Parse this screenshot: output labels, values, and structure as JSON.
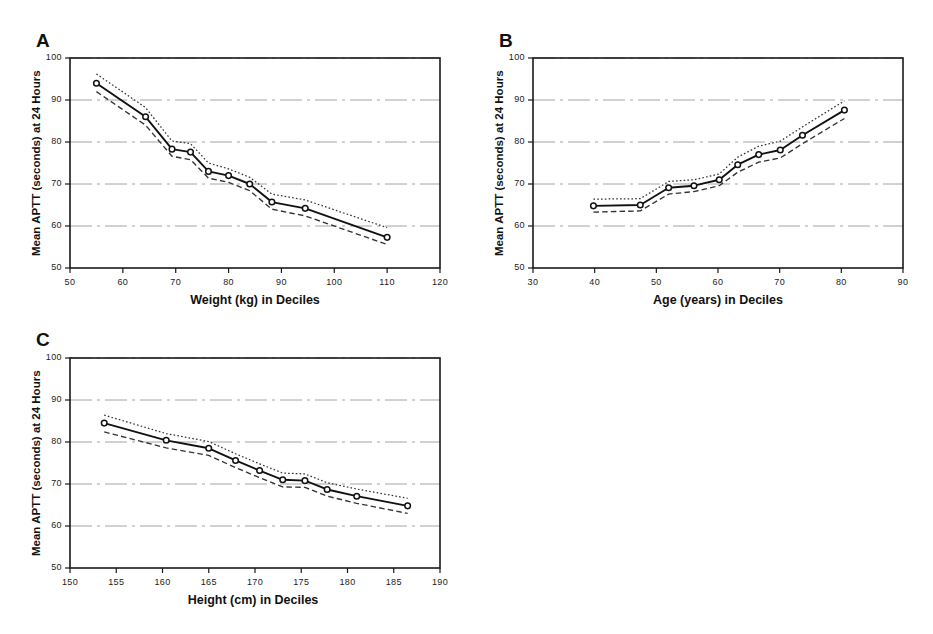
{
  "figure": {
    "ylabel": "Mean APTT (seconds) at 24 Hours",
    "panel_letters": [
      "A",
      "B",
      "C"
    ]
  },
  "chart_data": [
    {
      "panel": "A",
      "type": "line",
      "title": "A",
      "xlabel": "Weight (kg) in Deciles",
      "ylabel": "Mean APTT (seconds) at 24 Hours",
      "xlim": [
        50,
        120
      ],
      "ylim": [
        50,
        100
      ],
      "xticks": [
        50,
        60,
        70,
        80,
        90,
        100,
        110,
        120
      ],
      "xticklabels": [
        "50",
        "60",
        "70",
        "80",
        "90",
        "100",
        "110",
        "120"
      ],
      "yticks": [
        50,
        60,
        70,
        80,
        90,
        100
      ],
      "yticklabels": [
        "50",
        "60",
        "70",
        "80",
        "90",
        "100"
      ],
      "grid": "horizontal",
      "legend": "none",
      "x": [
        55.0,
        64.3,
        69.3,
        72.8,
        76.2,
        80.0,
        84.0,
        88.2,
        94.5,
        110.0
      ],
      "series": [
        {
          "name": "mean",
          "style": "solid-with-markers",
          "values": [
            94.0,
            86.0,
            78.3,
            77.6,
            73.0,
            72.0,
            70.0,
            65.7,
            64.2,
            57.3
          ]
        },
        {
          "name": "upper-confidence-limit",
          "style": "dotted",
          "values": [
            96.2,
            88.2,
            80.2,
            79.6,
            75.0,
            73.6,
            71.6,
            67.6,
            66.2,
            59.6
          ]
        },
        {
          "name": "lower-confidence-limit",
          "style": "dashed",
          "values": [
            92.0,
            84.0,
            76.6,
            75.8,
            71.4,
            70.4,
            68.4,
            64.0,
            62.4,
            55.6
          ]
        }
      ]
    },
    {
      "panel": "B",
      "type": "line",
      "title": "B",
      "xlabel": "Age (years) in Deciles",
      "ylabel": "Mean APTT (seconds) at 24 Hours",
      "xlim": [
        30,
        90
      ],
      "ylim": [
        50,
        100
      ],
      "xticks": [
        30,
        40,
        50,
        60,
        70,
        80,
        90
      ],
      "xticklabels": [
        "30",
        "40",
        "50",
        "60",
        "70",
        "80",
        "90"
      ],
      "yticks": [
        50,
        60,
        70,
        80,
        90,
        100
      ],
      "yticklabels": [
        "50",
        "60",
        "70",
        "80",
        "90",
        "100"
      ],
      "grid": "horizontal",
      "legend": "none",
      "x": [
        39.8,
        47.4,
        52.0,
        56.1,
        60.2,
        63.2,
        66.6,
        70.1,
        73.7,
        80.5
      ],
      "series": [
        {
          "name": "mean",
          "style": "solid-with-markers",
          "values": [
            64.8,
            65.0,
            69.1,
            69.6,
            71.0,
            74.6,
            77.0,
            78.1,
            81.6,
            87.6
          ]
        },
        {
          "name": "upper-confidence-limit",
          "style": "dotted",
          "values": [
            66.4,
            66.5,
            70.6,
            71.0,
            72.4,
            76.4,
            79.0,
            80.2,
            83.6,
            89.8
          ]
        },
        {
          "name": "lower-confidence-limit",
          "style": "dashed",
          "values": [
            63.3,
            63.6,
            67.6,
            68.2,
            69.6,
            72.8,
            75.2,
            76.2,
            79.6,
            85.6
          ]
        }
      ]
    },
    {
      "panel": "C",
      "type": "line",
      "title": "C",
      "xlabel": "Height (cm) in Deciles",
      "ylabel": "Mean APTT (seconds) at 24 Hours",
      "xlim": [
        150,
        190
      ],
      "ylim": [
        50,
        100
      ],
      "xticks": [
        150,
        155,
        160,
        165,
        170,
        175,
        180,
        185,
        190
      ],
      "xticklabels": [
        "150",
        "155",
        "160",
        "165",
        "170",
        "175",
        "180",
        "185",
        "190"
      ],
      "yticks": [
        50,
        60,
        70,
        80,
        90,
        100
      ],
      "yticklabels": [
        "50",
        "60",
        "70",
        "80",
        "90",
        "100"
      ],
      "grid": "horizontal",
      "legend": "none",
      "x": [
        153.7,
        160.4,
        165.0,
        167.9,
        170.5,
        173.0,
        175.4,
        177.8,
        181.0,
        186.5
      ],
      "series": [
        {
          "name": "mean",
          "style": "solid-with-markers",
          "values": [
            84.5,
            80.4,
            78.5,
            75.6,
            73.2,
            71.0,
            70.8,
            68.7,
            67.1,
            64.8
          ]
        },
        {
          "name": "upper-confidence-limit",
          "style": "dotted",
          "values": [
            86.4,
            82.0,
            80.1,
            77.2,
            74.8,
            72.6,
            72.4,
            70.3,
            68.8,
            66.6
          ]
        },
        {
          "name": "lower-confidence-limit",
          "style": "dashed",
          "values": [
            82.4,
            78.6,
            76.8,
            73.9,
            71.5,
            69.3,
            69.2,
            67.1,
            65.4,
            63.0
          ]
        }
      ]
    }
  ]
}
